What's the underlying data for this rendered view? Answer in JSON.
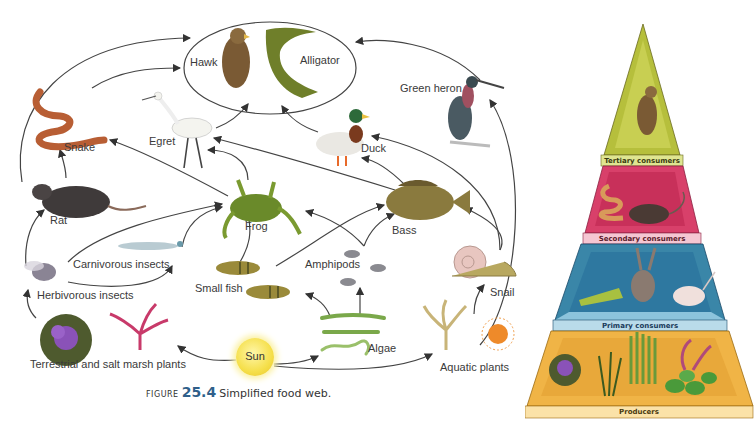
{
  "food_web": {
    "organisms": {
      "hawk": "Hawk",
      "alligator": "Alligator",
      "green_heron": "Green heron",
      "snake": "Snake",
      "egret": "Egret",
      "duck": "Duck",
      "rat": "Rat",
      "frog": "Frog",
      "bass": "Bass",
      "carnivorous_insects": "Carnivorous insects",
      "herbivorous_insects": "Herbivorous insects",
      "small_fish": "Small fish",
      "amphipods": "Amphipods",
      "snail": "Snail",
      "terrestrial_plants": "Terrestrial and salt marsh plants",
      "sun": "Sun",
      "algae": "Algae",
      "aquatic_plants": "Aquatic plants"
    },
    "caption": {
      "prefix": "Figure",
      "number": "25.4",
      "text": "Simplified food web."
    }
  },
  "pyramid": {
    "tiers": [
      {
        "label": "Tertiary consumers",
        "color": "#b6bf3c",
        "band": "#dfe590"
      },
      {
        "label": "Secondary consumers",
        "color": "#d8406a",
        "band": "#f5c6d2"
      },
      {
        "label": "Primary consumers",
        "color": "#3a86a8",
        "band": "#b9dbea"
      },
      {
        "label": "Producers",
        "color": "#f0b446",
        "band": "#fbe2a8"
      }
    ]
  },
  "colors": {
    "arrow": "#333333",
    "caption_number": "#2f5f8a"
  }
}
